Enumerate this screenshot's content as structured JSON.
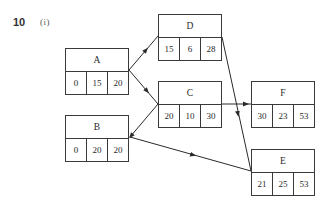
{
  "question": {
    "number": "10",
    "part": "(i)"
  },
  "nodes": {
    "A": {
      "label": "A",
      "values": [
        "0",
        "15",
        "20"
      ]
    },
    "B": {
      "label": "B",
      "values": [
        "0",
        "20",
        "20"
      ]
    },
    "C": {
      "label": "C",
      "values": [
        "20",
        "10",
        "30"
      ]
    },
    "D": {
      "label": "D",
      "values": [
        "15",
        "6",
        "28"
      ]
    },
    "E": {
      "label": "E",
      "values": [
        "21",
        "25",
        "53"
      ]
    },
    "F": {
      "label": "F",
      "values": [
        "30",
        "23",
        "53"
      ]
    }
  },
  "edges": [
    {
      "from": "A",
      "to": "D"
    },
    {
      "from": "A",
      "to": "C"
    },
    {
      "from": "C",
      "to": "B"
    },
    {
      "from": "B",
      "to": "E"
    },
    {
      "from": "C",
      "to": "F"
    },
    {
      "from": "D",
      "to": "E"
    }
  ],
  "colors": {
    "line": "#2a2a2a",
    "box_border": "#3a3a3a",
    "background": "#ffffff"
  }
}
